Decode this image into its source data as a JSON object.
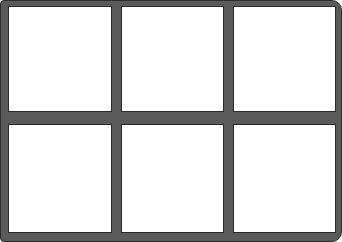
{
  "grid": {
    "rows": 2,
    "columns": 3,
    "frame_color": "#5a5a5a",
    "panel_color": "#ffffff",
    "panels": [
      {
        "row": 1,
        "col": 1,
        "x": 8,
        "y": 6,
        "w": 104,
        "h": 106
      },
      {
        "row": 1,
        "col": 2,
        "x": 121,
        "y": 6,
        "w": 103,
        "h": 106
      },
      {
        "row": 1,
        "col": 3,
        "x": 233,
        "y": 6,
        "w": 103,
        "h": 106
      },
      {
        "row": 2,
        "col": 1,
        "x": 8,
        "y": 124,
        "w": 104,
        "h": 109
      },
      {
        "row": 2,
        "col": 2,
        "x": 121,
        "y": 124,
        "w": 103,
        "h": 109
      },
      {
        "row": 2,
        "col": 3,
        "x": 233,
        "y": 124,
        "w": 103,
        "h": 109
      }
    ]
  }
}
